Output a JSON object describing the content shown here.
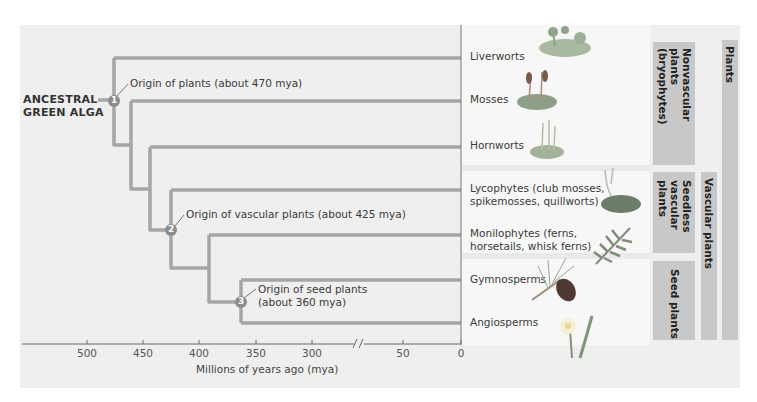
{
  "diagram": {
    "root_label_line1": "ANCESTRAL",
    "root_label_line2": "GREEN ALGA",
    "nodes": [
      {
        "number": "1",
        "label": "Origin of plants (about 470 mya)"
      },
      {
        "number": "2",
        "label": "Origin of vascular plants (about 425 mya)"
      },
      {
        "number": "3",
        "label_line1": "Origin of seed plants",
        "label_line2": "(about 360 mya)"
      }
    ],
    "taxa": [
      {
        "name": "Liverworts"
      },
      {
        "name": "Mosses"
      },
      {
        "name": "Hornworts"
      },
      {
        "line1": "Lycophytes (club mosses,",
        "line2": "spikemosses, quillworts)"
      },
      {
        "line1": "Monilophytes (ferns,",
        "line2": "horsetails, whisk ferns)"
      },
      {
        "name": "Gymnosperms"
      },
      {
        "name": "Angiosperms"
      }
    ],
    "groups": {
      "nonvascular": "Nonvascular plants (bryophytes)",
      "nonvascular_l1": "Nonvascular",
      "nonvascular_l2": "plants",
      "nonvascular_l3": "(bryophytes)",
      "seedless_l1": "Seedless",
      "seedless_l2": "vascular",
      "seedless_l3": "plants",
      "seed": "Seed plants",
      "vascular": "Vascular plants",
      "plants": "Plants"
    },
    "axis": {
      "title": "Millions of years ago (mya)",
      "ticks": [
        "500",
        "450",
        "400",
        "350",
        "300",
        "50",
        "0"
      ],
      "break_symbol": "//"
    },
    "colors": {
      "branch": "#a6a6a6",
      "node_fill": "#8c8c8c",
      "bar": "#c8c8c8",
      "panel": "#efefef"
    }
  }
}
